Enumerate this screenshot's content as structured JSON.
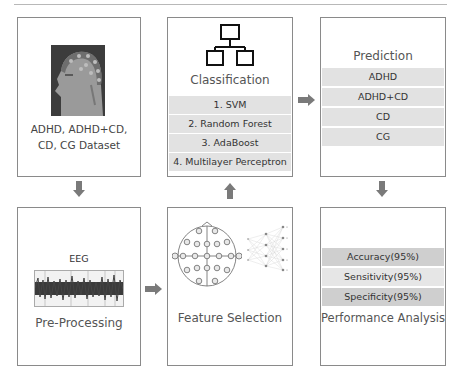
{
  "diagram": {
    "colors": {
      "border": "#8a8a8a",
      "arrow": "#7a7a7a",
      "row_light": "#e2e2e2",
      "row_dark": "#cfcfcf",
      "text": "#3a3a3a"
    },
    "dataset": {
      "icon": "eeg-cap-head-image",
      "line1": "ADHD, ADHD+CD,",
      "line2": "CD, CG Dataset"
    },
    "classification": {
      "icon": "hierarchy-tree-icon",
      "title": "Classification",
      "methods": [
        "1. SVM",
        "2. Random Forest",
        "3. AdaBoost",
        "4. Multilayer Perceptron"
      ]
    },
    "prediction": {
      "title": "Prediction",
      "classes": [
        "ADHD",
        "ADHD+CD",
        "CD",
        "CG"
      ]
    },
    "preprocessing": {
      "signal_label": "EEG",
      "icon": "eeg-signal-waveform",
      "title": "Pre-Processing"
    },
    "feature_selection": {
      "icon": "electrode-map-and-neural-network",
      "title": "Feature Selection"
    },
    "performance": {
      "metrics": [
        "Accuracy(95%)",
        "Sensitivity(95%)",
        "Specificity(95%)"
      ],
      "title": "Performance Analysis"
    },
    "flow": [
      "Dataset → Pre-Processing",
      "Pre-Processing → Feature Selection",
      "Feature Selection → Classification",
      "Classification → Prediction",
      "Prediction → Performance Analysis"
    ]
  }
}
